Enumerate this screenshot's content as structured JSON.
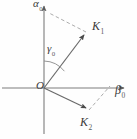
{
  "figure": {
    "type": "vector-diagram",
    "background_color": "#fefefe",
    "axis_color": "#7a7a7a",
    "vector_color": "#6a6a6a",
    "dashed_color": "#9a9a9a",
    "label_color": "#3a3a3a",
    "width": 137,
    "height": 139,
    "origin": {
      "x": 44,
      "y": 88
    },
    "axes": {
      "vertical": {
        "name": "alpha-axis",
        "label": "α",
        "subscript": "0",
        "from": {
          "x": 44,
          "y": 133
        },
        "to": {
          "x": 44,
          "y": 4
        },
        "arrow": "up"
      },
      "horizontal": {
        "name": "beta-axis",
        "label": "β",
        "subscript": "0",
        "from": {
          "x": 2,
          "y": 88
        },
        "to": {
          "x": 127,
          "y": 88
        },
        "arrow": "right"
      }
    },
    "vectors": [
      {
        "name": "K1",
        "label": "K",
        "subscript": "1",
        "from": {
          "x": 44,
          "y": 88
        },
        "to": {
          "x": 87,
          "y": 31
        },
        "direction": "up-right"
      },
      {
        "name": "K2",
        "label": "K",
        "subscript": "2",
        "from": {
          "x": 44,
          "y": 88
        },
        "to": {
          "x": 89,
          "y": 110
        },
        "direction": "down-right"
      }
    ],
    "dashed_lines": [
      {
        "name": "k1-projection-to-alpha-axis",
        "from": {
          "x": 87,
          "y": 31
        },
        "to": {
          "x": 50,
          "y": 13
        }
      },
      {
        "name": "k2-projection-to-beta-axis",
        "from": {
          "x": 89,
          "y": 110
        },
        "to": {
          "x": 110,
          "y": 87
        }
      }
    ],
    "angle_arc": {
      "name": "gamma-angle",
      "label": "γ",
      "subscript": "0",
      "center": {
        "x": 44,
        "y": 88
      },
      "radius": 27,
      "between": [
        "alpha-axis",
        "K1"
      ]
    },
    "origin_label": "O"
  }
}
